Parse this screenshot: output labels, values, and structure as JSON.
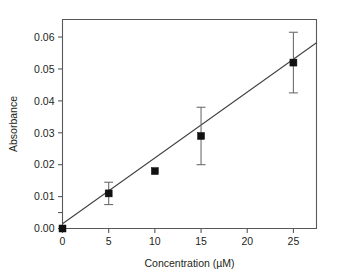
{
  "chart_data": {
    "type": "scatter",
    "title": "",
    "xlabel": "Concentration (µM)",
    "ylabel": "Absorbance",
    "xlim": [
      0,
      27.5
    ],
    "ylim": [
      0,
      0.0655
    ],
    "grid": false,
    "legend": "none",
    "x_ticks": [
      0,
      5,
      10,
      15,
      20,
      25
    ],
    "x_tick_labels": [
      "0",
      "5",
      "10",
      "15",
      "20",
      "25"
    ],
    "y_ticks": [
      0.0,
      0.01,
      0.02,
      0.03,
      0.04,
      0.05,
      0.06
    ],
    "y_tick_labels": [
      "0.00",
      "0.01",
      "0.02",
      "0.03",
      "0.04",
      "0.05",
      "0.06"
    ],
    "y_minor_ticks": [
      0.005
    ],
    "marker_style": "filled-square",
    "x": [
      0,
      5,
      10,
      15,
      25
    ],
    "y": [
      0.0,
      0.011,
      0.018,
      0.029,
      0.052
    ],
    "y_err": [
      0.0,
      0.0035,
      0.0005,
      0.009,
      0.0095
    ],
    "series": [
      {
        "name": "Absorbance vs Concentration",
        "points": [
          {
            "x": 0,
            "y": 0.0,
            "err": 0.0
          },
          {
            "x": 5,
            "y": 0.011,
            "err": 0.0035
          },
          {
            "x": 10,
            "y": 0.018,
            "err": 0.0005
          },
          {
            "x": 15,
            "y": 0.029,
            "err": 0.009
          },
          {
            "x": 25,
            "y": 0.052,
            "err": 0.0095
          }
        ]
      }
    ],
    "fit_line": {
      "type": "linear-regression",
      "x_start": 0,
      "y_start": 0.0015,
      "x_end": 27.5,
      "y_end": 0.0582
    }
  }
}
